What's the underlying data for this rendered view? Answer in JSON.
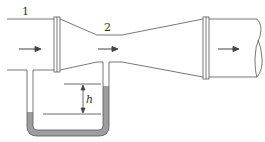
{
  "diagram": {
    "labels": {
      "section_1": "1",
      "section_2": "2",
      "height": "h"
    },
    "colors": {
      "line": "#555555",
      "fluid": "#9e9e9e",
      "background": "#ffffff"
    },
    "flow_direction": "left-to-right"
  }
}
